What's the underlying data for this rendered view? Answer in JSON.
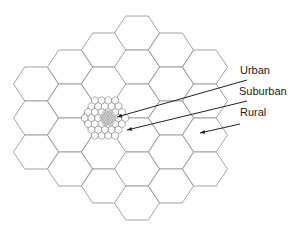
{
  "diagram": {
    "title": "",
    "line_color": "#9a9a9a",
    "arrow_color": "#222222",
    "urban_fill": "#8a8a8a",
    "macro_cells": {
      "radius": 22.5,
      "half_height": 17,
      "columns": [
        {
          "cx": 36,
          "cys": [
            84,
            118,
            152
          ]
        },
        {
          "cx": 70,
          "cys": [
            67,
            101,
            135,
            169
          ]
        },
        {
          "cx": 104,
          "cys": [
            50,
            84,
            118,
            152,
            186
          ]
        },
        {
          "cx": 137,
          "cys": [
            33,
            67,
            101,
            135,
            169,
            203
          ]
        },
        {
          "cx": 171,
          "cys": [
            50,
            84,
            118,
            152,
            186
          ]
        },
        {
          "cx": 205,
          "cys": [
            67,
            101,
            135,
            169
          ]
        }
      ]
    },
    "suburban_cluster": {
      "cx": 105,
      "cy": 118,
      "radius": 3.9,
      "rings": 3
    },
    "urban_cluster": {
      "cx": 108,
      "cy": 118,
      "radius": 1.4,
      "rings": 3
    },
    "labels": [
      {
        "id": "urban",
        "text": "Urban",
        "x": 240,
        "y": 65
      },
      {
        "id": "suburban",
        "text": "Suburban",
        "x": 239,
        "y": 86
      },
      {
        "id": "rural",
        "text": "Rural",
        "x": 240,
        "y": 107
      }
    ],
    "arrows": [
      {
        "id": "urban",
        "x1": 247,
        "y1": 80,
        "x2": 117,
        "y2": 117
      },
      {
        "id": "suburban",
        "x1": 247,
        "y1": 101,
        "x2": 127,
        "y2": 130
      },
      {
        "id": "rural",
        "x1": 240,
        "y1": 124,
        "x2": 200,
        "y2": 133
      }
    ]
  }
}
